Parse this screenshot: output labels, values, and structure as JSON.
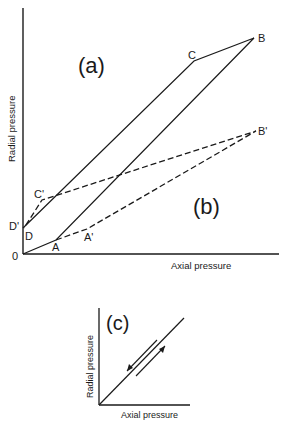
{
  "main_figure": {
    "panel_labels": {
      "a": "(a)",
      "b": "(b)"
    },
    "xlabel": "Axial pressure",
    "ylabel": "Radial pressure",
    "origin_label": "0",
    "points": {
      "A": "A",
      "B": "B",
      "C": "C",
      "D": "D",
      "A_prime": "A'",
      "B_prime": "B'",
      "C_prime": "C'",
      "D_prime": "D'"
    }
  },
  "inset": {
    "panel_label": "(c)",
    "xlabel": "Axial pressure",
    "ylabel": "Radial pressure"
  },
  "colors": {
    "ink": "#1a1a1a",
    "background": "#ffffff"
  }
}
